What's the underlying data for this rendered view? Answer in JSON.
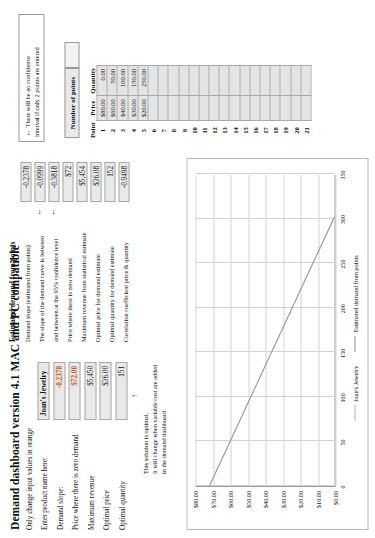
{
  "document": {
    "title": "Demand dashboard version 4.1 MAC and PC compatible",
    "instruction": "Only change input values in orange"
  },
  "inputs": {
    "product_name_label": "Enter product name here:",
    "product_name_value": "Joan's Jewelry",
    "rows": [
      {
        "label": "Demand slope:",
        "value": "-0.2378",
        "orange": true
      },
      {
        "label": "Price where there is zero demand",
        "value": "$72.00",
        "orange": true
      },
      {
        "label": "Maximum revenue",
        "value": "$5,450",
        "orange": false
      },
      {
        "label": "Optimal price",
        "value": "$36.00",
        "orange": false
      },
      {
        "label": "Optimal quantity",
        "value": "151",
        "orange": false
      }
    ]
  },
  "optimal_note": {
    "line1": "This solution is optimal.",
    "line2": "It will change when variable cost are added",
    "line3": "in the demand dashboard",
    "arrow": "↑"
  },
  "estimated": {
    "heading": "Estimated demand from points",
    "rows": [
      {
        "label": "Demand slope (estimated from points)",
        "value": "-0.2378"
      },
      {
        "label": "The slope of the demand curve is between",
        "value": "-0.0999",
        "arrow": true
      },
      {
        "label": "and between at the 95% confidence level",
        "value": "-0.3818",
        "arrow": true
      },
      {
        "label": "Price where there is zero demand",
        "value": "$72"
      },
      {
        "label": "Maximum revenue from statistical estimate",
        "value": "$5,454"
      },
      {
        "label": "Optimal price for demand estimate",
        "value": "$36.08"
      },
      {
        "label": "Optimal quantity for demand estimate",
        "value": "152"
      },
      {
        "label": "Correlation coefficient price & quantity",
        "value": "-0.9498"
      }
    ]
  },
  "confidence_note": {
    "arrow": "←",
    "line1": "There will be no confidence",
    "line2": "interval if only 2 points are entered"
  },
  "points_panel": {
    "number_of_points_label": "Number of points",
    "number_of_points_value": "",
    "columns": [
      "Point",
      "Price",
      "Quantity"
    ],
    "rows": [
      {
        "point": "1",
        "price": "$80.00",
        "quantity": "0.00"
      },
      {
        "point": "2",
        "price": "$60.00",
        "quantity": "50.00"
      },
      {
        "point": "3",
        "price": "$40.00",
        "quantity": "100.00"
      },
      {
        "point": "4",
        "price": "$30.00",
        "quantity": "150.00"
      },
      {
        "point": "5",
        "price": "$20.00",
        "quantity": "250.00"
      },
      {
        "point": "6",
        "price": "",
        "quantity": ""
      },
      {
        "point": "7",
        "price": "",
        "quantity": ""
      },
      {
        "point": "8",
        "price": "",
        "quantity": ""
      },
      {
        "point": "9",
        "price": "",
        "quantity": ""
      },
      {
        "point": "10",
        "price": "",
        "quantity": ""
      },
      {
        "point": "11",
        "price": "",
        "quantity": ""
      },
      {
        "point": "12",
        "price": "",
        "quantity": ""
      },
      {
        "point": "13",
        "price": "",
        "quantity": ""
      },
      {
        "point": "14",
        "price": "",
        "quantity": ""
      },
      {
        "point": "15",
        "price": "",
        "quantity": ""
      },
      {
        "point": "16",
        "price": "",
        "quantity": ""
      },
      {
        "point": "17",
        "price": "",
        "quantity": ""
      },
      {
        "point": "18",
        "price": "",
        "quantity": ""
      },
      {
        "point": "19",
        "price": "",
        "quantity": ""
      },
      {
        "point": "20",
        "price": "",
        "quantity": ""
      },
      {
        "point": "21",
        "price": "",
        "quantity": ""
      }
    ]
  },
  "chart_data": {
    "type": "line",
    "title": "",
    "xlabel": "",
    "ylabel": "",
    "xlim": [
      0,
      350
    ],
    "ylim": [
      0,
      80
    ],
    "xticks": [
      "0",
      "50",
      "100",
      "150",
      "200",
      "250",
      "300",
      "350"
    ],
    "yticks": [
      "$0.00",
      "$10.00",
      "$20.00",
      "$30.00",
      "$40.00",
      "$50.00",
      "$60.00",
      "$70.00",
      "$80.00"
    ],
    "grid": true,
    "legend_position": "bottom",
    "series": [
      {
        "name": "Joan's Jewelry",
        "color": "#b6b6b6",
        "x": [
          0,
          303
        ],
        "y": [
          72,
          0
        ]
      },
      {
        "name": "Estimated demand from points",
        "color": "#9a9a9a",
        "x": [
          0,
          303
        ],
        "y": [
          72,
          0
        ]
      }
    ]
  }
}
